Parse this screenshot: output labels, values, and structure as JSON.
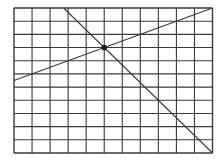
{
  "diagram": {
    "type": "grid-with-lines",
    "grid": {
      "columns": 11,
      "rows": 11
    },
    "lines": [
      {
        "name": "ascending-line",
        "from": [
          0,
          5.5
        ],
        "to": [
          11,
          0
        ]
      },
      {
        "name": "descending-line",
        "from": [
          2.75,
          0
        ],
        "to": [
          11,
          11
        ]
      }
    ],
    "intersection": {
      "point": [
        5,
        3
      ]
    },
    "colors": {
      "grid": "#3a3a3a",
      "line": "#3a3a3a",
      "dot": "#1a1a1a",
      "background": "#ffffff"
    }
  }
}
